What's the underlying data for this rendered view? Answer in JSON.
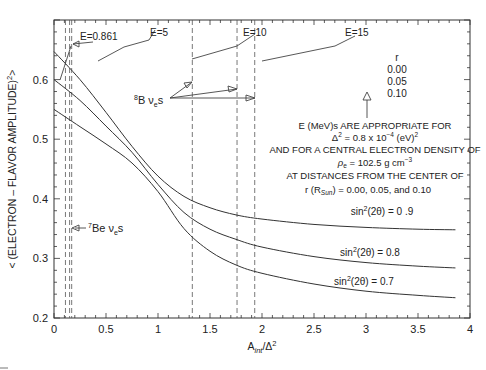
{
  "chart_data": {
    "type": "line",
    "title": "",
    "xlabel": "A_int/Δ²",
    "ylabel": "< (ELECTRON – FLAVOR AMPLITUDE)² >",
    "xlim": [
      0,
      4
    ],
    "ylim": [
      0.2,
      0.7
    ],
    "grid": false,
    "x_ticks": [
      0,
      0.5,
      1,
      1.5,
      2,
      2.5,
      3,
      3.5,
      4
    ],
    "x_tick_labels": [
      "0",
      "0.5",
      "1",
      "1.5",
      "2",
      "2.5",
      "3",
      "3.5",
      "4"
    ],
    "y_ticks": [
      0.2,
      0.3,
      0.4,
      0.5,
      0.6
    ],
    "y_tick_labels": [
      "0.2",
      "0.3",
      "0.4",
      "0.5",
      "0.6"
    ],
    "x": [
      0,
      0.25,
      0.5,
      0.75,
      1.0,
      1.25,
      1.5,
      1.75,
      2.0,
      2.5,
      3.0,
      3.5,
      3.86
    ],
    "series": [
      {
        "name": "sin²(2θ) = 0.9",
        "label": "sin²(2θ) = 0 .9",
        "values": [
          0.647,
          0.6,
          0.545,
          0.488,
          0.438,
          0.404,
          0.385,
          0.373,
          0.366,
          0.357,
          0.352,
          0.349,
          0.348
        ]
      },
      {
        "name": "sin²(2θ) = 0.8",
        "label": "sin²(2θ) =  0.8",
        "values": [
          0.6,
          0.565,
          0.522,
          0.478,
          0.424,
          0.377,
          0.349,
          0.332,
          0.319,
          0.303,
          0.293,
          0.287,
          0.284
        ]
      },
      {
        "name": "sin²(2θ) = 0.7",
        "label": "sin²(2θ) =  0.7",
        "values": [
          0.55,
          0.521,
          0.492,
          0.46,
          0.412,
          0.35,
          0.312,
          0.289,
          0.275,
          0.257,
          0.245,
          0.238,
          0.234
        ]
      }
    ],
    "dashed_verticals": [
      0.11,
      0.15,
      0.17,
      1.33,
      1.76,
      1.93
    ],
    "annotations": {
      "energy_labels": [
        "E=0.861",
        "E=5",
        "E=10",
        "E=15"
      ],
      "r_legend": {
        "title": "r",
        "values": [
          "0.00",
          "0.05",
          "0.10"
        ]
      },
      "b8_label": "⁸B νₑs",
      "be7_label": "⁷Be νₑs",
      "note_lines": [
        "E (MeV)s ARE APPROPRIATE FOR",
        "Δ² = 0.8 x 10⁻⁴ (eV)²",
        "AND FOR A CENTRAL ELECTRON DENSITY OF",
        "ρₑ = 102.5 g cm⁻³",
        "AT DISTANCES FROM THE CENTER OF",
        "r (R_Sun) = 0.00, 0.05, and 0.10"
      ]
    }
  },
  "labels": {
    "e0861": "E=0.861",
    "e5": "E=5",
    "e10": "E=10",
    "e15": "E=15",
    "r_title": "r",
    "r0": "0.00",
    "r1": "0.05",
    "r2": "0.10",
    "b8_sup": "8",
    "b8_main": "B ν",
    "b8_sub": "e",
    "b8_tail": "s",
    "be7_sup": "7",
    "be7_main": "Be ν",
    "be7_sub": "e",
    "be7_tail": "s",
    "note1": "E (MeV)s ARE APPROPRIATE FOR",
    "note2a": "Δ",
    "note2b": " = 0.8 x 10",
    "note2c": " (eV)",
    "note2_sup1": "2",
    "note2_sup2": "−4",
    "note2_sup3": "2",
    "note3": "AND FOR A CENTRAL ELECTRON DENSITY OF",
    "note4a": "ρ",
    "note4_sub": "e",
    "note4b": " =  102.5 g cm",
    "note4_sup": "−3",
    "note5": "AT DISTANCES FROM THE CENTER OF",
    "note6a": "r (R",
    "note6_sub": "Sun",
    "note6b": ")  = 0.00, 0.05,  and 0.10",
    "sin_pre": "sin",
    "sin_sup": "2",
    "sin_mid": "(2θ) = ",
    "s09": "0 .9",
    "s08": " 0.8",
    "s07": " 0.7",
    "xlabel_a": "A",
    "xlabel_sub": "int",
    "xlabel_b": "/Δ",
    "xlabel_sup": "2",
    "ylabel": "< (ELECTRON – FLAVOR AMPLITUDE)",
    "ylabel_sup": "2",
    "ylabel_end": ">"
  }
}
